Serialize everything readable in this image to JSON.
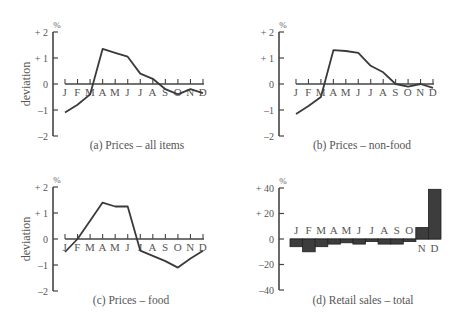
{
  "months": [
    "J",
    "F",
    "M",
    "A",
    "M",
    "J",
    "J",
    "A",
    "S",
    "O",
    "N",
    "D"
  ],
  "chart_data": [
    {
      "id": "a",
      "type": "line",
      "title": "(a)  Prices – all items",
      "ylabel": "deviation",
      "yunit": "%",
      "ylim": [
        -2,
        2
      ],
      "yticks": [
        "+ 2",
        "+ 1",
        "0",
        "–1",
        "–2"
      ],
      "ytick_values": [
        2,
        1,
        0,
        -1,
        -2
      ],
      "categories": [
        "J",
        "F",
        "M",
        "A",
        "M",
        "J",
        "J",
        "A",
        "S",
        "O",
        "N",
        "D"
      ],
      "values": [
        -1.1,
        -0.8,
        -0.4,
        1.35,
        1.2,
        1.05,
        0.4,
        0.2,
        -0.2,
        -0.4,
        -0.2,
        -0.35
      ],
      "grid": false
    },
    {
      "id": "b",
      "type": "line",
      "title": "(b)  Prices – non-food",
      "ylabel": "",
      "yunit": "%",
      "ylim": [
        -2,
        2
      ],
      "yticks": [
        "+ 2",
        "+ 1",
        "0",
        "–1",
        "–2"
      ],
      "ytick_values": [
        2,
        1,
        0,
        -1,
        -2
      ],
      "categories": [
        "J",
        "F",
        "M",
        "A",
        "M",
        "J",
        "J",
        "A",
        "S",
        "O",
        "N",
        "D"
      ],
      "values": [
        -1.15,
        -0.85,
        -0.5,
        1.3,
        1.27,
        1.2,
        0.7,
        0.45,
        0.0,
        -0.1,
        0.0,
        -0.15
      ],
      "grid": false
    },
    {
      "id": "c",
      "type": "line",
      "title": "(c)  Prices – food",
      "ylabel": "deviation",
      "yunit": "%",
      "ylim": [
        -2,
        2
      ],
      "yticks": [
        "+ 2",
        "+ 1",
        "0",
        "–1",
        "–2"
      ],
      "ytick_values": [
        2,
        1,
        0,
        -1,
        -2
      ],
      "categories": [
        "J",
        "F",
        "M",
        "A",
        "M",
        "J",
        "J",
        "A",
        "S",
        "O",
        "N",
        "D"
      ],
      "values": [
        -0.5,
        0.0,
        0.7,
        1.4,
        1.25,
        1.25,
        -0.45,
        -0.65,
        -0.85,
        -1.1,
        -0.75,
        -0.45
      ],
      "grid": false
    },
    {
      "id": "d",
      "type": "bar",
      "title": "(d)  Retail sales – total",
      "ylabel": "",
      "yunit": "%",
      "ylim": [
        -40,
        40
      ],
      "yticks": [
        "+ 40",
        "+ 20",
        "0",
        "–20",
        "–40"
      ],
      "ytick_values": [
        40,
        20,
        0,
        -20,
        -40
      ],
      "categories": [
        "J",
        "F",
        "M",
        "A",
        "M",
        "J",
        "J",
        "A",
        "S",
        "O",
        "N",
        "D"
      ],
      "values": [
        -6,
        -10,
        -6,
        -4,
        -3,
        -4,
        -2,
        -4,
        -4,
        -2,
        9,
        39
      ],
      "grid": false
    }
  ],
  "style": {
    "line_color": "#3a3a3a",
    "bar_fill": "#3d3d3d",
    "axis_color": "#444444",
    "text_color": "#555555"
  }
}
